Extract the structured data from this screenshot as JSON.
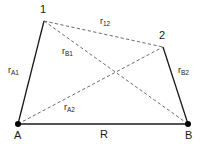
{
  "figure": {
    "type": "geometry-diagram",
    "background_color": "#ffffff",
    "line_color": "#1a1a1a",
    "dash_color": "#555555",
    "point_color": "#000000"
  },
  "points": {
    "p1": {
      "label": "1",
      "x": 44,
      "y": 21,
      "label_x": 40,
      "label_y": 4
    },
    "p2": {
      "label": "2",
      "x": 163,
      "y": 47,
      "label_x": 159,
      "label_y": 30
    },
    "pA": {
      "label": "A",
      "x": 18,
      "y": 124,
      "label_x": 14,
      "label_y": 130
    },
    "pB": {
      "label": "B",
      "x": 188,
      "y": 124,
      "label_x": 185,
      "label_y": 130
    }
  },
  "segments": [
    {
      "name": "r_A1",
      "base": "r",
      "sub": "A1",
      "from": "pA",
      "to": "p1",
      "style": "solid",
      "label_x": 8,
      "label_y": 66
    },
    {
      "name": "r_B2",
      "base": "r",
      "sub": "B2",
      "from": "pB",
      "to": "p2",
      "style": "solid",
      "label_x": 178,
      "label_y": 66
    },
    {
      "name": "R",
      "base": "R",
      "sub": "",
      "from": "pA",
      "to": "pB",
      "style": "solid",
      "label_x": 100,
      "label_y": 129
    },
    {
      "name": "r_12",
      "base": "r",
      "sub": "12",
      "from": "p1",
      "to": "p2",
      "style": "dashed",
      "label_x": 100,
      "label_y": 17
    },
    {
      "name": "r_B1",
      "base": "r",
      "sub": "B1",
      "from": "p1",
      "to": "pB",
      "style": "dashed",
      "label_x": 62,
      "label_y": 47
    },
    {
      "name": "r_A2",
      "base": "r",
      "sub": "A2",
      "from": "pA",
      "to": "p2",
      "style": "dashed",
      "label_x": 64,
      "label_y": 103
    }
  ]
}
